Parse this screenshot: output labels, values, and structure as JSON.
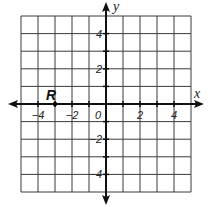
{
  "chart_data": {
    "type": "scatter",
    "title": "",
    "xlabel": "x",
    "ylabel": "y",
    "xlim": [
      -5,
      5
    ],
    "ylim": [
      -5,
      5
    ],
    "grid": true,
    "grid_step": 1,
    "x_tick_labels": [
      "-4",
      "-2",
      "0",
      "2",
      "4"
    ],
    "y_tick_labels": [
      "4",
      "2",
      "-2",
      "-4"
    ],
    "points": [
      {
        "label": "R",
        "x": -3,
        "y": 0
      }
    ]
  },
  "colors": {
    "grid": "#3a3a3a",
    "axis": "#111111",
    "background": "#ffffff"
  }
}
